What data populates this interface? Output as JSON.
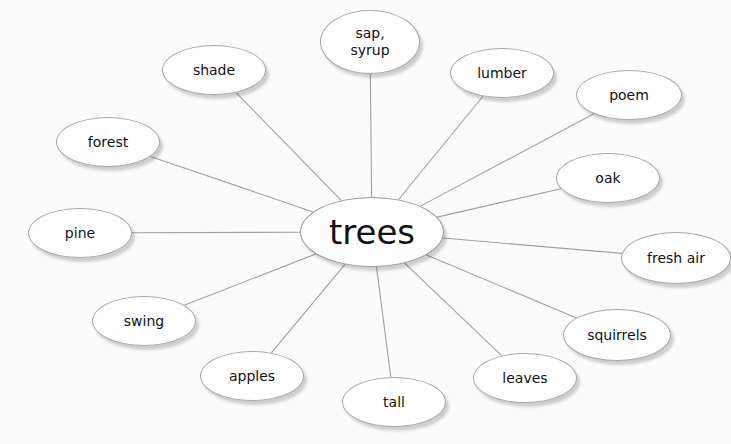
{
  "diagram": {
    "type": "concept-web",
    "center": {
      "id": "trees",
      "label": "trees",
      "cx": 372,
      "cy": 232,
      "rx": 72,
      "ry": 35
    },
    "nodes": [
      {
        "id": "sap-syrup",
        "label": "sap,\nsyrup",
        "cx": 370,
        "cy": 42,
        "rx": 50,
        "ry": 32
      },
      {
        "id": "lumber",
        "label": "lumber",
        "cx": 502,
        "cy": 73,
        "rx": 52,
        "ry": 25
      },
      {
        "id": "poem",
        "label": "poem",
        "cx": 629,
        "cy": 95,
        "rx": 53,
        "ry": 25
      },
      {
        "id": "oak",
        "label": "oak",
        "cx": 608,
        "cy": 178,
        "rx": 52,
        "ry": 25
      },
      {
        "id": "fresh-air",
        "label": "fresh air",
        "cx": 676,
        "cy": 258,
        "rx": 55,
        "ry": 26
      },
      {
        "id": "squirrels",
        "label": "squirrels",
        "cx": 617,
        "cy": 335,
        "rx": 54,
        "ry": 26
      },
      {
        "id": "leaves",
        "label": "leaves",
        "cx": 525,
        "cy": 378,
        "rx": 52,
        "ry": 25
      },
      {
        "id": "tall",
        "label": "tall",
        "cx": 394,
        "cy": 402,
        "rx": 52,
        "ry": 25
      },
      {
        "id": "apples",
        "label": "apples",
        "cx": 252,
        "cy": 376,
        "rx": 52,
        "ry": 25
      },
      {
        "id": "swing",
        "label": "swing",
        "cx": 144,
        "cy": 321,
        "rx": 52,
        "ry": 25
      },
      {
        "id": "pine",
        "label": "pine",
        "cx": 80,
        "cy": 233,
        "rx": 52,
        "ry": 25
      },
      {
        "id": "forest",
        "label": "forest",
        "cx": 108,
        "cy": 142,
        "rx": 52,
        "ry": 25
      },
      {
        "id": "shade",
        "label": "shade",
        "cx": 214,
        "cy": 70,
        "rx": 52,
        "ry": 25
      }
    ],
    "colors": {
      "line": "#a0a0a0",
      "border": "#a8a8a8",
      "fill": "#ffffff",
      "background": "#fbfbfb",
      "text": "#111111"
    }
  }
}
